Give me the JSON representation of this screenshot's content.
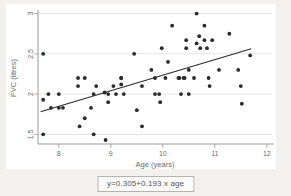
{
  "chart_data": {
    "type": "scatter",
    "title": "",
    "xlabel": "Age (years)",
    "ylabel": "FVC (litres)",
    "xlim": [
      7.6,
      12.1
    ],
    "ylim": [
      1.38,
      3.02
    ],
    "xticks": [
      8,
      9,
      10,
      11,
      12
    ],
    "xtick_labels": [
      "8",
      "9",
      "10",
      "11",
      "12"
    ],
    "yticks": [
      1.5,
      2,
      2.5,
      3
    ],
    "ytick_labels": [
      "1.5",
      "2",
      "2.5",
      "3"
    ],
    "grid": "horizontal",
    "legend": "none",
    "annotation": "y=0.305+0.193 x age",
    "fit_line": {
      "type": "linear",
      "intercept": 0.305,
      "slope": 0.193,
      "x_start": 7.65,
      "x_end": 11.7,
      "y_start": 1.78,
      "y_end": 2.563
    },
    "points": [
      [
        7.7,
        2.5
      ],
      [
        7.7,
        1.93
      ],
      [
        7.7,
        1.5
      ],
      [
        7.8,
        2.0
      ],
      [
        7.85,
        1.83
      ],
      [
        8.0,
        2.0
      ],
      [
        8.0,
        1.83
      ],
      [
        8.08,
        1.83
      ],
      [
        8.37,
        2.2
      ],
      [
        8.37,
        2.1
      ],
      [
        8.4,
        1.6
      ],
      [
        8.5,
        2.2
      ],
      [
        8.5,
        1.7
      ],
      [
        8.62,
        1.83
      ],
      [
        8.67,
        2.0
      ],
      [
        8.67,
        1.5
      ],
      [
        8.72,
        2.1
      ],
      [
        8.88,
        2.02
      ],
      [
        8.9,
        1.43
      ],
      [
        8.95,
        2.0
      ],
      [
        8.95,
        1.9
      ],
      [
        9.05,
        2.1
      ],
      [
        9.1,
        2.0
      ],
      [
        9.2,
        2.2
      ],
      [
        9.2,
        2.2
      ],
      [
        9.2,
        2.12
      ],
      [
        9.25,
        2.0
      ],
      [
        9.45,
        2.5
      ],
      [
        9.5,
        1.8
      ],
      [
        9.6,
        2.1
      ],
      [
        9.6,
        1.6
      ],
      [
        9.78,
        2.3
      ],
      [
        9.85,
        2.0
      ],
      [
        9.85,
        2.2
      ],
      [
        9.93,
        2.0
      ],
      [
        9.95,
        1.9
      ],
      [
        9.98,
        2.57
      ],
      [
        10.05,
        2.2
      ],
      [
        10.1,
        2.4
      ],
      [
        10.18,
        2.85
      ],
      [
        10.3,
        2.2
      ],
      [
        10.32,
        2.2
      ],
      [
        10.35,
        2.0
      ],
      [
        10.4,
        2.2
      ],
      [
        10.42,
        2.2
      ],
      [
        10.45,
        2.57
      ],
      [
        10.45,
        2.67
      ],
      [
        10.5,
        2.3
      ],
      [
        10.5,
        2.0
      ],
      [
        10.6,
        2.2
      ],
      [
        10.65,
        3.0
      ],
      [
        10.65,
        2.63
      ],
      [
        10.7,
        2.72
      ],
      [
        10.72,
        2.57
      ],
      [
        10.8,
        2.85
      ],
      [
        10.8,
        2.67
      ],
      [
        10.85,
        2.57
      ],
      [
        10.88,
        2.2
      ],
      [
        10.9,
        2.1
      ],
      [
        10.95,
        2.67
      ],
      [
        11.08,
        2.3
      ],
      [
        11.28,
        2.75
      ],
      [
        11.45,
        2.3
      ],
      [
        11.5,
        2.1
      ],
      [
        11.52,
        1.88
      ],
      [
        11.68,
        2.48
      ]
    ]
  },
  "caption": {
    "equation": "y=0.305+0.193 x age"
  }
}
